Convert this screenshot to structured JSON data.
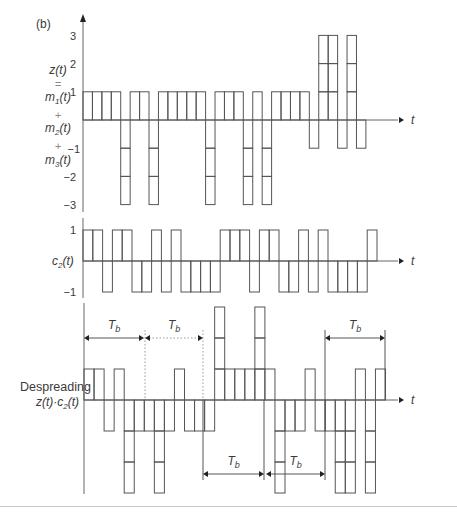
{
  "panel_label": "(b)",
  "axis_var": "t",
  "plots": {
    "z": {
      "label_lines": [
        "z(t)",
        "=",
        "m1(t)",
        "+",
        "m2(t)",
        "+",
        "m3(t)"
      ],
      "ticks": [
        "3",
        "2",
        "1",
        "−1",
        "−2",
        "−3"
      ],
      "tick_values": [
        3,
        2,
        1,
        -1,
        -2,
        -3
      ],
      "x0": 83,
      "chip_w": 9.43,
      "baseline_y": 120,
      "unit": 28.2,
      "axis_top": 18,
      "axis_bottom": 212,
      "axis_right": 398,
      "chips": [
        1,
        1,
        1,
        1,
        -3,
        1,
        1,
        -3,
        1,
        1,
        1,
        1,
        1,
        -3,
        1,
        1,
        1,
        -3,
        1,
        -3,
        1,
        1,
        1,
        1,
        -1,
        3,
        3,
        -1,
        3,
        -1
      ]
    },
    "c2": {
      "label": "c2(t)",
      "ticks": [
        "1",
        "−1"
      ],
      "tick_values": [
        1,
        -1
      ],
      "x0": 83,
      "chip_w": 9.8,
      "baseline_y": 261,
      "unit": 31,
      "axis_top": 218,
      "axis_bottom": 298,
      "axis_right": 398,
      "chips": [
        1,
        1,
        -1,
        1,
        1,
        -1,
        -1,
        1,
        -1,
        1,
        -1,
        -1,
        -1,
        -1,
        1,
        1,
        1,
        -1,
        1,
        1,
        -1,
        -1,
        1,
        -1,
        1,
        -1,
        -1,
        -1,
        -1,
        1
      ]
    },
    "despread": {
      "label_line1": "Despreading",
      "label_line2": "z(t)·c2(t)",
      "x0": 84,
      "chip_w": 10.05,
      "baseline_y": 400,
      "unit": 31,
      "axis_top": 303,
      "axis_bottom": 494,
      "axis_right": 398,
      "chips": [
        1,
        1,
        -1,
        1,
        -3,
        -1,
        -1,
        -3,
        -1,
        1,
        -1,
        -1,
        -1,
        3,
        1,
        1,
        1,
        3,
        1,
        -3,
        -1,
        -1,
        1,
        -1,
        -1,
        -3,
        -3,
        1,
        -3,
        1
      ]
    }
  },
  "tb_annotations": [
    {
      "label": "T",
      "sub": "b",
      "x1": 84,
      "x2": 144,
      "y": 338,
      "style": "solid"
    },
    {
      "label": "T",
      "sub": "b",
      "x1": 145,
      "x2": 203,
      "y": 338,
      "style": "dotted"
    },
    {
      "label": "T",
      "sub": "b",
      "x1": 325,
      "x2": 385,
      "y": 338,
      "style": "solid"
    },
    {
      "label": "T",
      "sub": "b",
      "x1": 203,
      "x2": 264,
      "y": 474,
      "style": "solid"
    },
    {
      "label": "T",
      "sub": "b",
      "x1": 266,
      "x2": 325,
      "y": 474,
      "style": "solid"
    }
  ],
  "guide_lines": [
    {
      "x": 145,
      "y1": 330,
      "y2": 400,
      "style": "dotted"
    },
    {
      "x": 203,
      "y1": 330,
      "y2": 400,
      "style": "dotted"
    },
    {
      "x": 203,
      "y1": 400,
      "y2": 480,
      "style": "solid"
    },
    {
      "x": 264,
      "y1": 400,
      "y2": 480,
      "style": "solid"
    },
    {
      "x": 325,
      "y1": 330,
      "y2": 480,
      "style": "solid"
    },
    {
      "x": 385,
      "y1": 330,
      "y2": 400,
      "style": "solid"
    }
  ],
  "colors": {
    "line": "#555555",
    "axis": "#666666",
    "text": "#3a3a3a",
    "rule": "#c8c8c8"
  }
}
